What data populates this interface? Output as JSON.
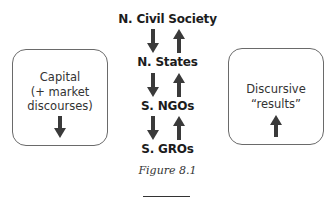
{
  "diagram": {
    "nodes": [
      {
        "label": "N. Civil Society"
      },
      {
        "label": "N. States"
      },
      {
        "label": "S. NGOs"
      },
      {
        "label": "S. GROs"
      }
    ],
    "left_box": {
      "lines": [
        "Capital",
        "(+ market",
        "discourses)"
      ],
      "arrow": "down-arrow-icon"
    },
    "right_box": {
      "lines": [
        "Discursive",
        "“results”"
      ],
      "arrow": "up-arrow-icon"
    },
    "arrow_pairs": [
      {
        "down": "down-arrow-icon",
        "up": "up-arrow-icon"
      },
      {
        "down": "down-arrow-icon",
        "up": "up-arrow-icon"
      },
      {
        "down": "down-arrow-icon",
        "up": "up-arrow-icon"
      }
    ],
    "colors": {
      "arrow": "#3a3a3a",
      "border": "#6a6a6a",
      "text": "#1c1c1c"
    }
  },
  "caption": "Figure 8.1"
}
